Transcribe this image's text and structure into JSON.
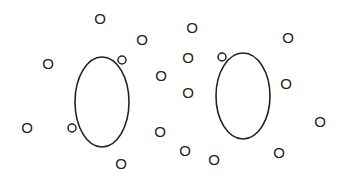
{
  "diagram": {
    "background": "#ffffff",
    "stroke_color": "#222222",
    "particle_glyph": "O",
    "loops": [
      {
        "name": "left-loop",
        "cx": 102,
        "cy": 102,
        "rx": 27,
        "ry": 45,
        "knobs": [
          {
            "x": 122,
            "y": 60
          },
          {
            "x": 72,
            "y": 128
          }
        ]
      },
      {
        "name": "right-loop",
        "cx": 243,
        "cy": 96,
        "rx": 27,
        "ry": 43,
        "knobs": [
          {
            "x": 222,
            "y": 57
          }
        ]
      }
    ],
    "particles": [
      {
        "x": 100,
        "y": 18,
        "label": "O"
      },
      {
        "x": 48,
        "y": 63,
        "label": "O"
      },
      {
        "x": 142,
        "y": 39,
        "label": "O"
      },
      {
        "x": 161,
        "y": 75,
        "label": "O"
      },
      {
        "x": 27,
        "y": 127,
        "label": "O"
      },
      {
        "x": 160,
        "y": 131,
        "label": "O"
      },
      {
        "x": 121,
        "y": 163,
        "label": "O"
      },
      {
        "x": 192,
        "y": 27,
        "label": "O"
      },
      {
        "x": 188,
        "y": 57,
        "label": "O"
      },
      {
        "x": 188,
        "y": 92,
        "label": "O"
      },
      {
        "x": 185,
        "y": 150,
        "label": "O"
      },
      {
        "x": 214,
        "y": 159,
        "label": "O"
      },
      {
        "x": 288,
        "y": 37,
        "label": "O"
      },
      {
        "x": 286,
        "y": 83,
        "label": "O"
      },
      {
        "x": 320,
        "y": 121,
        "label": "O"
      },
      {
        "x": 279,
        "y": 152,
        "label": "O"
      }
    ]
  }
}
